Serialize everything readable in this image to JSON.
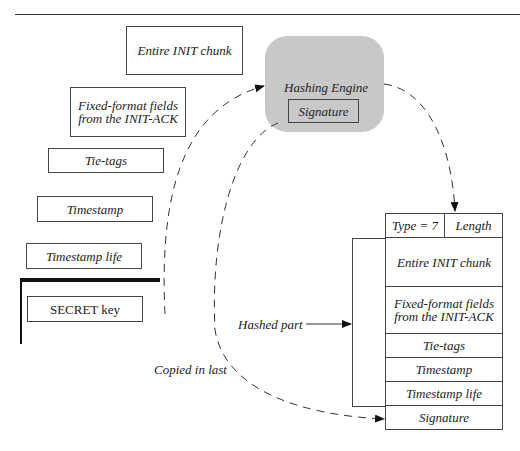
{
  "inputs": {
    "entire_init_chunk": "Entire INIT chunk",
    "fixed_format_line1": "Fixed-format fields",
    "fixed_format_line2": "from the INIT-ACK",
    "tie_tags": "Tie-tags",
    "timestamp": "Timestamp",
    "timestamp_life": "Timestamp life",
    "secret_key": "SECRET key"
  },
  "engine": {
    "title": "Hashing Engine",
    "output": "Signature"
  },
  "cookie": {
    "type": "Type = 7",
    "length": "Length",
    "rows": [
      {
        "line1": "Entire INIT chunk",
        "line2": ""
      },
      {
        "line1": "Fixed-format fields",
        "line2": "from the INIT-ACK"
      },
      {
        "line1": "Tie-tags",
        "line2": ""
      },
      {
        "line1": "Timestamp",
        "line2": ""
      },
      {
        "line1": "Timestamp life",
        "line2": ""
      }
    ],
    "signature": "Signature"
  },
  "annotations": {
    "hashed_part": "Hashed part",
    "copied_in_last": "Copied in last"
  }
}
